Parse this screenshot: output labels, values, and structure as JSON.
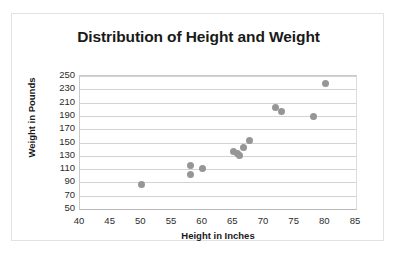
{
  "chart_data": {
    "type": "scatter",
    "title": "Distribution of Height and Weight",
    "xlabel": "Height in Inches",
    "ylabel": "Weight in Pounds",
    "xlim": [
      40,
      85
    ],
    "ylim": [
      50,
      250
    ],
    "xticks": [
      40,
      45,
      50,
      55,
      60,
      65,
      70,
      75,
      80,
      85
    ],
    "yticks": [
      50,
      70,
      90,
      110,
      130,
      150,
      170,
      190,
      210,
      230,
      250
    ],
    "grid": "horizontal",
    "legend": "none",
    "marker_color": "#969696",
    "series": [
      {
        "name": "Height vs Weight",
        "points": [
          [
            50,
            87
          ],
          [
            58,
            116
          ],
          [
            58,
            102
          ],
          [
            60,
            111
          ],
          [
            65,
            136
          ],
          [
            65.6,
            134
          ],
          [
            66,
            131
          ],
          [
            66.6,
            142
          ],
          [
            67.6,
            153
          ],
          [
            71.8,
            203
          ],
          [
            72.8,
            197
          ],
          [
            78,
            189
          ],
          [
            80,
            238
          ]
        ]
      }
    ]
  }
}
